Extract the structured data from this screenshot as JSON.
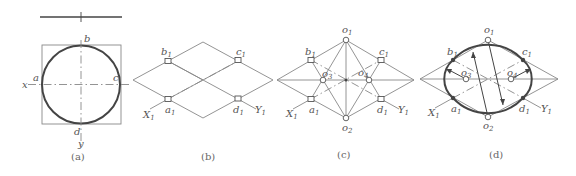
{
  "figure": {
    "panels": [
      {
        "id": "a",
        "caption": "(a)",
        "points": {
          "a": "a",
          "b": "b",
          "c": "c",
          "d": "d"
        },
        "axes": {
          "x": "x",
          "y": "y"
        }
      },
      {
        "id": "b",
        "caption": "(b)",
        "points": {
          "a1": "a",
          "b1": "b",
          "c1": "c",
          "d1": "d",
          "sub": "1"
        },
        "axes": {
          "x": "X",
          "y": "Y",
          "sub": "1"
        }
      },
      {
        "id": "c",
        "caption": "(c)",
        "points": {
          "o1": "o",
          "o2": "o",
          "o3": "o",
          "o4": "o",
          "a1": "a",
          "b1": "b",
          "c1": "c",
          "d1": "d"
        },
        "subs": {
          "o1": "1",
          "o2": "2",
          "o3": "3",
          "o4": "4",
          "one": "1"
        },
        "axes": {
          "x": "X",
          "y": "Y"
        }
      },
      {
        "id": "d",
        "caption": "(d)",
        "points": {
          "o1": "o",
          "o2": "o",
          "o3": "o",
          "o4": "o",
          "a1": "a",
          "b1": "b",
          "c1": "c",
          "d1": "d"
        },
        "subs": {
          "o1": "1",
          "o2": "2",
          "o3": "3",
          "o4": "4",
          "one": "1"
        },
        "axes": {
          "x": "X",
          "y": "Y"
        }
      }
    ]
  }
}
